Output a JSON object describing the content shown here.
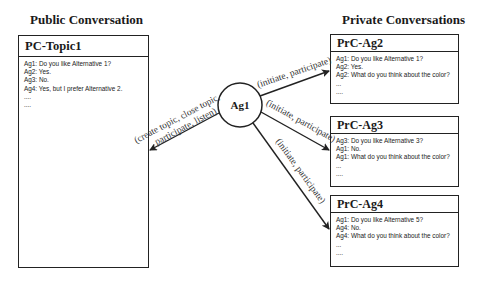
{
  "public": {
    "title": "Public Conversation",
    "conversation": {
      "name": "PC-Topic1",
      "lines": [
        "Ag1: Do you like Alternative 1?",
        "Ag2: Yes.",
        "Ag3: No.",
        "Ag4: Yes, but I prefer  Alternative 2.",
        "....",
        "...."
      ]
    }
  },
  "private": {
    "title": "Private Conversations",
    "conversations": [
      {
        "name": "PrC-Ag2",
        "lines": [
          "Ag1: Do you like Alternative 1?",
          "Ag2: Yes.",
          "Ag2: What do you think about the color?",
          "...",
          "...."
        ]
      },
      {
        "name": "PrC-Ag3",
        "lines": [
          "Ag3: Do you like Alternative 3?",
          "Ag1: No.",
          "Ag1: What do you think about the color?",
          "...",
          "...."
        ]
      },
      {
        "name": "PrC-Ag4",
        "lines": [
          "Ag1: Do you like Alternative 5?",
          "Ag4: No.",
          "Ag4: What do you think about the color?",
          "...",
          "...."
        ]
      }
    ]
  },
  "agent": {
    "name": "Ag1"
  },
  "edges": {
    "to_public": {
      "line1": "(create topic, close topic,",
      "line2": "participate, listen)"
    },
    "to_ag2": "(initiate, participate)",
    "to_ag3": "(initiate, participate)",
    "to_ag4": "(initiate, participate)"
  },
  "colors": {
    "stroke": "#222222",
    "text": "#1a1a1a",
    "background": "#ffffff"
  }
}
